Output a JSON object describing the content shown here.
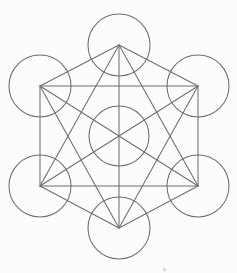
{
  "figure": {
    "type": "geometric-diagram",
    "canvas": {
      "width": 237,
      "height": 273
    },
    "colors": {
      "background": "#fcfcfc",
      "stroke": "#6e6e72",
      "fill": "none",
      "speck": "#d9d9dd"
    },
    "stroke_width": 1.05,
    "nodes": [
      {
        "id": "center",
        "label": "center circle",
        "cx": 119,
        "cy": 136,
        "r": 30
      },
      {
        "id": "top",
        "label": "top circle",
        "cx": 119,
        "cy": 45,
        "r": 31
      },
      {
        "id": "top-left",
        "label": "top left circle",
        "cx": 40,
        "cy": 86,
        "r": 31
      },
      {
        "id": "top-right",
        "label": "top right circle",
        "cx": 198,
        "cy": 86,
        "r": 31
      },
      {
        "id": "bottom-left",
        "label": "bottom left circle",
        "cx": 40,
        "cy": 186,
        "r": 31
      },
      {
        "id": "bottom-right",
        "label": "bottom right circle",
        "cx": 198,
        "cy": 186,
        "r": 31
      },
      {
        "id": "bottom",
        "label": "bottom circle",
        "cx": 119,
        "cy": 228,
        "r": 31
      }
    ],
    "edges": [
      {
        "from": "top",
        "to": "top-left"
      },
      {
        "from": "top",
        "to": "top-right"
      },
      {
        "from": "top-left",
        "to": "top-right"
      },
      {
        "from": "top-left",
        "to": "bottom-left"
      },
      {
        "from": "top-right",
        "to": "bottom-right"
      },
      {
        "from": "bottom-left",
        "to": "bottom-right"
      },
      {
        "from": "bottom-left",
        "to": "bottom"
      },
      {
        "from": "bottom-right",
        "to": "bottom"
      },
      {
        "from": "top",
        "to": "bottom-left"
      },
      {
        "from": "top",
        "to": "bottom-right"
      },
      {
        "from": "top",
        "to": "bottom"
      },
      {
        "from": "top-left",
        "to": "bottom-right"
      },
      {
        "from": "top-left",
        "to": "bottom"
      },
      {
        "from": "top-right",
        "to": "bottom-left"
      },
      {
        "from": "top-right",
        "to": "bottom"
      }
    ],
    "edge_count": 15,
    "node_count": 7,
    "specks": [
      {
        "x": 163,
        "y": 268,
        "w": 3,
        "h": 3
      }
    ]
  }
}
